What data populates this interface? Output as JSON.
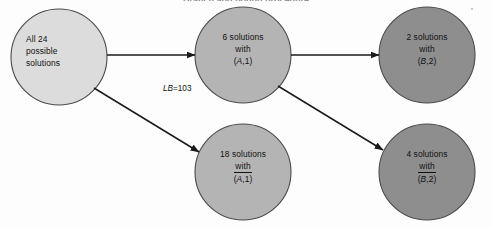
{
  "figure": {
    "title_fragment": "Branch and bound procedure",
    "width": 492,
    "height": 227,
    "background": "#fdfdfd"
  },
  "colors": {
    "node_light": "#dcdcdc",
    "node_medium": "#b4b4b4",
    "node_dark": "#8e8e8e",
    "outline": "#4a4a4a",
    "arrow": "#1a1a1a",
    "text": "#111111"
  },
  "nodes": [
    {
      "id": "root",
      "name": "all-solutions-node",
      "cx": 59,
      "cy": 57,
      "r": 48,
      "fill": "#dcdcdc",
      "align": "left",
      "lines": [
        {
          "text": "All 24",
          "style": "plain"
        },
        {
          "text": "possible",
          "style": "plain"
        },
        {
          "text": "solutions",
          "style": "plain"
        }
      ]
    },
    {
      "id": "a1",
      "name": "a1-node",
      "cx": 243,
      "cy": 55,
      "r": 48,
      "fill": "#b4b4b4",
      "align": "center",
      "lines": [
        {
          "text": "6 solutions",
          "style": "plain"
        },
        {
          "text": "with",
          "style": "plain"
        },
        {
          "text": "(A,1)",
          "style": "italic-letter",
          "letter": "A",
          "prefix": "(",
          "suffix": ",1)"
        }
      ]
    },
    {
      "id": "a1bar",
      "name": "a1-complement-node",
      "cx": 243,
      "cy": 172,
      "r": 48,
      "fill": "#b4b4b4",
      "align": "center",
      "lines": [
        {
          "text": "18 solutions",
          "style": "plain"
        },
        {
          "text": "with",
          "style": "plain"
        },
        {
          "text": "(A,1)",
          "style": "overline-italic-letter",
          "letter": "A",
          "prefix": "(",
          "suffix": ",1)"
        }
      ]
    },
    {
      "id": "b2",
      "name": "b2-node",
      "cx": 427,
      "cy": 55,
      "r": 48,
      "fill": "#8e8e8e",
      "align": "center",
      "lines": [
        {
          "text": "2 solutions",
          "style": "plain"
        },
        {
          "text": "with",
          "style": "plain"
        },
        {
          "text": "(B,2)",
          "style": "italic-letter",
          "letter": "B",
          "prefix": "(",
          "suffix": ",2)"
        }
      ]
    },
    {
      "id": "b2bar",
      "name": "b2-complement-node",
      "cx": 427,
      "cy": 172,
      "r": 48,
      "fill": "#8e8e8e",
      "align": "center",
      "lines": [
        {
          "text": "4 solutions",
          "style": "plain"
        },
        {
          "text": "with",
          "style": "plain"
        },
        {
          "text": "(B,2)",
          "style": "overline-italic-letter",
          "letter": "B",
          "prefix": "(",
          "suffix": ",2)"
        }
      ]
    }
  ],
  "annotations": {
    "lower_bound": {
      "symbol": "LB",
      "equals": "=",
      "value": "103",
      "full": "LB=103"
    }
  },
  "edges": [
    {
      "id": "root-to-a1",
      "name": "edge-root-to-a1",
      "from": "root",
      "to": "a1"
    },
    {
      "id": "root-to-a1bar",
      "name": "edge-root-to-a1-complement",
      "from": "root",
      "to": "a1bar"
    },
    {
      "id": "a1-to-b2",
      "name": "edge-a1-to-b2",
      "from": "a1",
      "to": "b2"
    },
    {
      "id": "a1-to-b2bar",
      "name": "edge-a1-to-b2-complement",
      "from": "a1",
      "to": "b2bar"
    }
  ]
}
